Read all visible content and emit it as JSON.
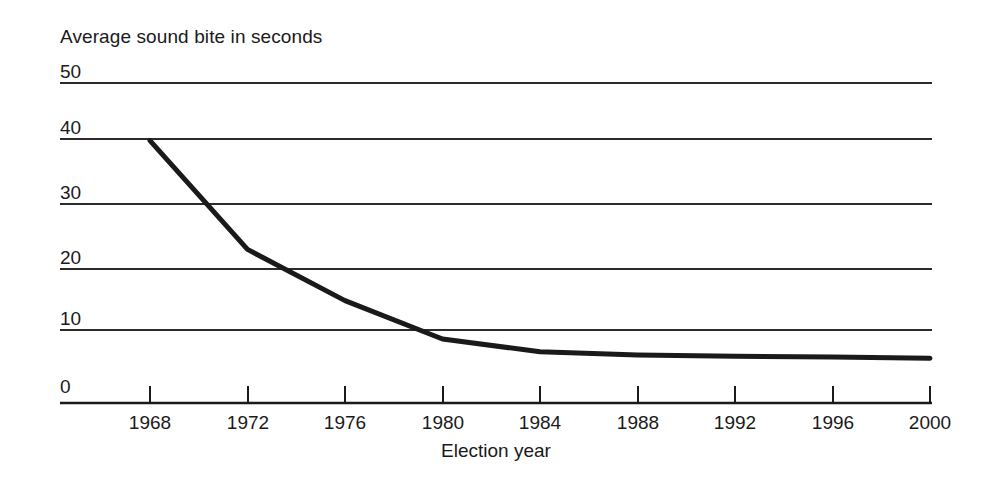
{
  "chart_data": {
    "type": "line",
    "title": "",
    "ylabel": "Average sound bite in seconds",
    "xlabel": "Election year",
    "x": [
      1968,
      1972,
      1976,
      1980,
      1984,
      1988,
      1992,
      1996,
      2000
    ],
    "categories": [
      "1968",
      "1972",
      "1976",
      "1980",
      "1984",
      "1988",
      "1992",
      "1996",
      "2000"
    ],
    "values": [
      41,
      24,
      16,
      10,
      8,
      7.5,
      7.3,
      7.2,
      7
    ],
    "series": [
      {
        "name": "Average sound bite in seconds",
        "values": [
          41,
          24,
          16,
          10,
          8,
          7.5,
          7.3,
          7.2,
          7
        ]
      }
    ],
    "ylim": [
      0,
      50
    ],
    "xlim": [
      1968,
      2000
    ],
    "yticks": [
      0,
      10,
      20,
      30,
      40,
      50
    ],
    "ytick_labels": [
      "0",
      "10",
      "20",
      "30",
      "40",
      "50"
    ],
    "xtick_labels": [
      "1968",
      "1972",
      "1976",
      "1980",
      "1984",
      "1988",
      "1992",
      "1996",
      "2000"
    ],
    "grid": true,
    "grid_axis": "y",
    "legend": false,
    "line_color": "#1a1a1a",
    "grid_color": "#2b2b2b",
    "axis_color": "#1a1a1a",
    "background": "#ffffff"
  },
  "axes": {
    "y_title": "Average sound bite in seconds",
    "x_title": "Election year"
  },
  "ytick_labels": [
    "50",
    "40",
    "30",
    "20",
    "10",
    "0"
  ],
  "xtick_labels": [
    "1968",
    "1972",
    "1976",
    "1980",
    "1984",
    "1988",
    "1992",
    "1996",
    "2000"
  ]
}
